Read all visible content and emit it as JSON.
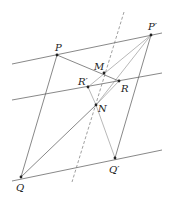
{
  "diagram": {
    "labels": {
      "P": "P",
      "P_prime": "P′",
      "M": "M",
      "R": "R",
      "R_prime": "R′",
      "N": "N",
      "Q": "Q",
      "Q_prime": "Q′"
    }
  }
}
